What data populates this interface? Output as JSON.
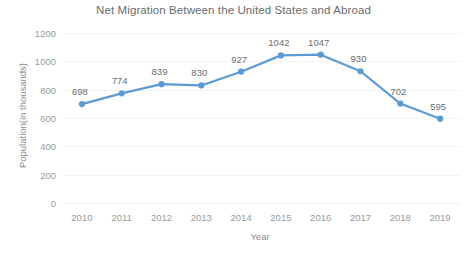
{
  "chart_data": {
    "type": "line",
    "title": "Net Migration Between the United States and Abroad",
    "xlabel": "Year",
    "ylabel": "Population(in thousands)",
    "categories": [
      "2010",
      "2011",
      "2012",
      "2013",
      "2014",
      "2015",
      "2016",
      "2017",
      "2018",
      "2019"
    ],
    "values": [
      698,
      774,
      839,
      830,
      927,
      1042,
      1047,
      930,
      702,
      595
    ],
    "data_labels": [
      "698",
      "774",
      "839",
      "830",
      "927",
      "1042",
      "1047",
      "930",
      "702",
      "595"
    ],
    "ylim": [
      0,
      1200
    ],
    "yticks": [
      1200,
      1000,
      800,
      600,
      400,
      200,
      0
    ],
    "ytick_labels": [
      "1200",
      "1000",
      "800",
      "600",
      "400",
      "200",
      "0"
    ],
    "grid": true,
    "legend": "none",
    "series_color": "#5b9bd5",
    "marker": "circle",
    "title_color": "#6b6b6b",
    "axis_label_color": "#9a9a9a",
    "gridline_color": "#f2f2f2"
  }
}
